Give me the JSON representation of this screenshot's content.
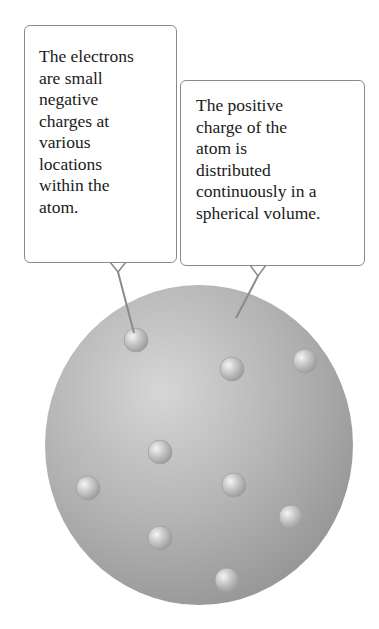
{
  "figure": {
    "callouts": [
      {
        "id": "electrons",
        "text": "The electrons\nare small\nnegative\ncharges at\nvarious\nlocations\nwithin the\natom.",
        "points_to": "electron"
      },
      {
        "id": "positive-charge",
        "text": "The positive\ncharge of the\natom is\ndistributed\ncontinuously in a\nspherical volume.",
        "points_to": "sphere"
      }
    ],
    "sphere": {
      "cx": 199,
      "cy": 445,
      "rx": 154,
      "ry": 160,
      "color_light": "#d4d4d4",
      "color_mid": "#b0b0b0",
      "color_dark": "#8e8e8e"
    },
    "electrons": [
      {
        "cx": 136,
        "cy": 340
      },
      {
        "cx": 232,
        "cy": 369
      },
      {
        "cx": 305,
        "cy": 361
      },
      {
        "cx": 160,
        "cy": 452
      },
      {
        "cx": 88,
        "cy": 488
      },
      {
        "cx": 234,
        "cy": 485
      },
      {
        "cx": 291,
        "cy": 517
      },
      {
        "cx": 160,
        "cy": 538
      },
      {
        "cx": 227,
        "cy": 580
      }
    ],
    "electron_radius": 12,
    "border_color": "#8a8a8a"
  }
}
